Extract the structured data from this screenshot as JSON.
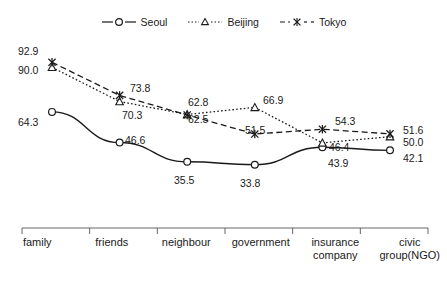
{
  "chart_data": {
    "type": "line",
    "title": "",
    "subtitle": "",
    "xlabel": "",
    "ylabel": "",
    "ylim": [
      25,
      100
    ],
    "grid": false,
    "legend_position": "top-center",
    "categories": [
      "family",
      "friends",
      "neighbour",
      "government",
      "insurance company",
      "civic group(NGO)"
    ],
    "series": [
      {
        "name": "Seoul",
        "marker": "circle",
        "line_style": "solid",
        "color": "#1a1a1a",
        "values": [
          64.3,
          46.6,
          35.5,
          33.8,
          43.9,
          42.1
        ]
      },
      {
        "name": "Beijing",
        "marker": "triangle",
        "line_style": "dotted",
        "color": "#1a1a1a",
        "values": [
          90.0,
          70.3,
          62.8,
          66.9,
          46.4,
          50.0
        ]
      },
      {
        "name": "Tokyo",
        "marker": "x",
        "line_style": "dashed",
        "color": "#1a1a1a",
        "values": [
          92.9,
          73.8,
          62.5,
          51.5,
          54.3,
          51.6
        ]
      }
    ]
  },
  "legend": {
    "items": [
      {
        "label": "Seoul",
        "icon": "line-circle-marker-icon"
      },
      {
        "label": "Beijing",
        "icon": "line-triangle-marker-icon"
      },
      {
        "label": "Tokyo",
        "icon": "line-x-marker-icon"
      }
    ]
  },
  "axis": {
    "categories": [
      {
        "line1": "family",
        "line2": ""
      },
      {
        "line1": "friends",
        "line2": ""
      },
      {
        "line1": "neighbour",
        "line2": ""
      },
      {
        "line1": "government",
        "line2": ""
      },
      {
        "line1": "insurance",
        "line2": "company"
      },
      {
        "line1": "civic",
        "line2": "group(NGO)"
      }
    ]
  },
  "data_labels": [
    {
      "text": "92.9",
      "x": 18,
      "y": 46
    },
    {
      "text": "90.0",
      "x": 18,
      "y": 65
    },
    {
      "text": "64.3",
      "x": 18,
      "y": 117
    },
    {
      "text": "73.8",
      "x": 130,
      "y": 83
    },
    {
      "text": "70.3",
      "x": 122,
      "y": 110
    },
    {
      "text": "46.6",
      "x": 125,
      "y": 135
    },
    {
      "text": "62.8",
      "x": 188,
      "y": 97
    },
    {
      "text": "62.5",
      "x": 188,
      "y": 114
    },
    {
      "text": "35.5",
      "x": 174,
      "y": 175
    },
    {
      "text": "66.9",
      "x": 263,
      "y": 95
    },
    {
      "text": "51.5",
      "x": 245,
      "y": 125
    },
    {
      "text": "33.8",
      "x": 240,
      "y": 178
    },
    {
      "text": "54.3",
      "x": 335,
      "y": 116
    },
    {
      "text": "46.4",
      "x": 329,
      "y": 142
    },
    {
      "text": "43.9",
      "x": 328,
      "y": 158
    },
    {
      "text": "51.6",
      "x": 403,
      "y": 125
    },
    {
      "text": "50.0",
      "x": 403,
      "y": 137
    },
    {
      "text": "42.1",
      "x": 403,
      "y": 153
    }
  ],
  "colors": {
    "ink": "#1a1a1a",
    "line": "#222222",
    "background": "#ffffff"
  }
}
